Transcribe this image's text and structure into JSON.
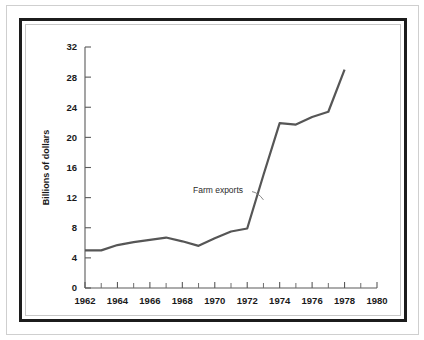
{
  "figure": {
    "background_color": "#ffffff",
    "frame_color": "#1c1c1c",
    "inner_frame_color": "#c8c8c8",
    "line_color": "#565656",
    "axis_color": "#5a5a5a"
  },
  "chart_data": {
    "type": "line",
    "title": "",
    "subtitle": "",
    "xlabel": "",
    "ylabel": "Billions of dollars",
    "xlim": [
      1962,
      1980
    ],
    "ylim": [
      0,
      32
    ],
    "grid": false,
    "legend_position": "none",
    "x_tick_labels": [
      "1962",
      "1964",
      "1966",
      "1968",
      "1970",
      "1972",
      "1974",
      "1976",
      "1978",
      "1980"
    ],
    "x_major_ticks": [
      1962,
      1964,
      1966,
      1968,
      1970,
      1972,
      1974,
      1976,
      1978,
      1980
    ],
    "x_minor_ticks": [
      1963,
      1965,
      1967,
      1969,
      1971,
      1973,
      1975,
      1977,
      1979
    ],
    "y_tick_labels": [
      "0",
      "4",
      "8",
      "12",
      "16",
      "20",
      "24",
      "28",
      "32"
    ],
    "y_ticks": [
      0,
      4,
      8,
      12,
      16,
      20,
      24,
      28,
      32
    ],
    "annotations": [
      {
        "text": "Farm exports",
        "x": 1970.2,
        "y": 12.6,
        "points_to_x": 1973.0,
        "points_to_y": 11.7
      }
    ],
    "series": [
      {
        "name": "Farm exports",
        "color": "#565656",
        "x": [
          1962,
          1963,
          1964,
          1965,
          1966,
          1967,
          1968,
          1969,
          1970,
          1971,
          1972,
          1973,
          1974,
          1975,
          1976,
          1977,
          1978
        ],
        "values": [
          5.0,
          5.0,
          5.7,
          6.1,
          6.4,
          6.7,
          6.2,
          5.6,
          6.6,
          7.5,
          7.9,
          15.0,
          21.9,
          21.7,
          22.7,
          23.4,
          29.0
        ]
      }
    ]
  }
}
